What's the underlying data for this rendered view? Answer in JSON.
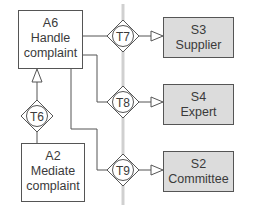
{
  "diagram": {
    "type": "organization-construction-diagram",
    "colors": {
      "line": "#555555",
      "boundary": "#d0d0d0",
      "actor_fill": "#ffffff",
      "external_fill": "#dcdcdc",
      "text": "#3a3a3a"
    },
    "actors": [
      {
        "id": "A6",
        "code": "A6",
        "line1": "Handle",
        "line2": "complaint"
      },
      {
        "id": "A2",
        "code": "A2",
        "line1": "Mediate",
        "line2": "complaint"
      }
    ],
    "external_systems": [
      {
        "id": "S3",
        "code": "S3",
        "name": "Supplier"
      },
      {
        "id": "S4",
        "code": "S4",
        "name": "Expert"
      },
      {
        "id": "S2",
        "code": "S2",
        "name": "Committee"
      }
    ],
    "transactions": [
      {
        "id": "T6",
        "label": "T6"
      },
      {
        "id": "T7",
        "label": "T7"
      },
      {
        "id": "T8",
        "label": "T8"
      },
      {
        "id": "T9",
        "label": "T9"
      }
    ],
    "links": [
      {
        "from": "A2",
        "via": "T6",
        "to": "A6"
      },
      {
        "from": "A6",
        "via": "T7",
        "to": "S3"
      },
      {
        "from": "A6",
        "via": "T8",
        "to": "S4"
      },
      {
        "from": "A6",
        "via": "T9",
        "to": "S2"
      }
    ]
  }
}
